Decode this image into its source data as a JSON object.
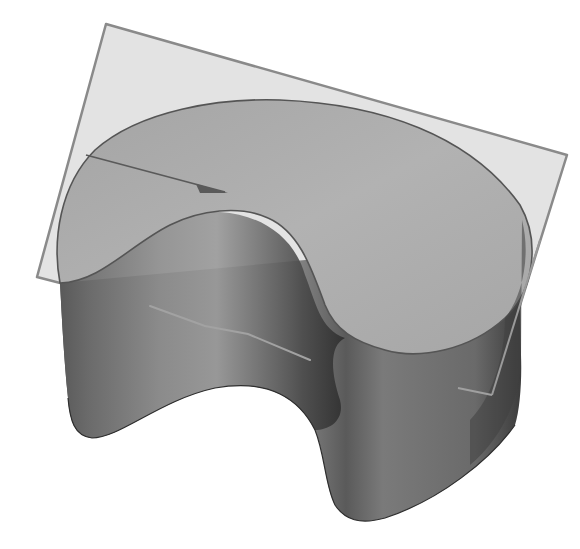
{
  "figure": {
    "background_color": "#ffffff",
    "colors": {
      "plane_fill": "#e2e2e2",
      "plane_edge": "#8a8a8a",
      "top_face": "#a9a9a9",
      "top_face_edge": "#555555",
      "side_wall_dark": "#3e3e3e",
      "side_wall_mid": "#6a6a6a",
      "side_wall_light": "#8e8e8e",
      "inner_face": "#b4b4b4",
      "section_line": "#9d9d9d",
      "arrow": "#5a5a5a"
    }
  }
}
